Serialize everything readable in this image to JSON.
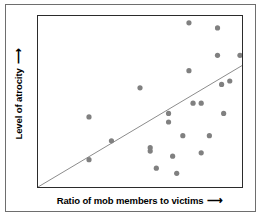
{
  "chart_data": {
    "type": "scatter",
    "title": "",
    "xlabel": "Ratio of mob members to victims",
    "ylabel": "Level of atrocity",
    "xlabel_arrow": "⟶",
    "ylabel_arrow": "⟶",
    "grid": false,
    "legend": "none",
    "axis_ticks": "none",
    "xlim": [
      0,
      100
    ],
    "ylim": [
      0,
      100
    ],
    "point_color": "#808080",
    "trend_line_color": "#8c8c8c",
    "frame_color": "#2b2b2b",
    "outer_frame_color": "#6e6e6e",
    "background_color": "#ffffff",
    "series": [
      {
        "name": "observations",
        "points": [
          [
            25,
            41
          ],
          [
            25,
            16
          ],
          [
            36,
            27
          ],
          [
            50,
            58
          ],
          [
            55,
            23
          ],
          [
            55,
            21
          ],
          [
            58,
            11
          ],
          [
            64,
            43
          ],
          [
            64,
            38
          ],
          [
            66,
            18
          ],
          [
            68,
            8
          ],
          [
            71,
            30
          ],
          [
            74,
            96
          ],
          [
            74,
            68
          ],
          [
            76,
            49
          ],
          [
            80,
            49
          ],
          [
            80,
            20
          ],
          [
            84,
            30
          ],
          [
            88,
            93
          ],
          [
            88,
            77
          ],
          [
            90,
            60
          ],
          [
            91,
            43
          ],
          [
            94,
            62
          ],
          [
            99,
            77
          ]
        ]
      }
    ],
    "trend_line": {
      "x0": 0,
      "y0": 0,
      "x1": 100,
      "y1": 71
    }
  }
}
